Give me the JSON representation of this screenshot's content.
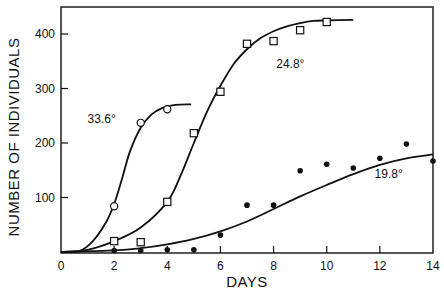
{
  "chart_data": {
    "type": "scatter",
    "title": "",
    "xlabel": "DAYS",
    "ylabel": "NUMBER OF INDIVIDUALS",
    "xlim": [
      0,
      14
    ],
    "ylim": [
      0,
      440
    ],
    "grid": false,
    "legend": "none (series labeled inline)",
    "x_ticks": [
      0,
      2,
      4,
      6,
      8,
      10,
      12,
      14
    ],
    "y_ticks": [
      100,
      200,
      300,
      400
    ],
    "series": [
      {
        "name": "33.6°",
        "marker": "open-circle",
        "points": [
          [
            2,
            84
          ],
          [
            3,
            237
          ],
          [
            4,
            262
          ]
        ],
        "curve": [
          [
            0,
            0
          ],
          [
            0.7,
            2
          ],
          [
            1.2,
            20
          ],
          [
            1.7,
            55
          ],
          [
            2,
            88
          ],
          [
            2.3,
            135
          ],
          [
            2.6,
            185
          ],
          [
            3,
            228
          ],
          [
            3.4,
            252
          ],
          [
            3.8,
            264
          ],
          [
            4.3,
            270
          ],
          [
            4.9,
            271
          ]
        ],
        "label_pos": [
          1,
          237
        ]
      },
      {
        "name": "24.8°",
        "marker": "open-square",
        "points": [
          [
            2,
            20
          ],
          [
            3,
            18
          ],
          [
            4,
            92
          ],
          [
            5,
            218
          ],
          [
            6,
            294
          ],
          [
            7,
            382
          ],
          [
            8,
            387
          ],
          [
            9,
            407
          ],
          [
            10,
            422
          ]
        ],
        "curve": [
          [
            0,
            0
          ],
          [
            1,
            4
          ],
          [
            2,
            20
          ],
          [
            3,
            45
          ],
          [
            4,
            92
          ],
          [
            4.5,
            140
          ],
          [
            5,
            200
          ],
          [
            5.5,
            258
          ],
          [
            6,
            305
          ],
          [
            6.5,
            345
          ],
          [
            7,
            372
          ],
          [
            7.5,
            392
          ],
          [
            8,
            405
          ],
          [
            8.5,
            414
          ],
          [
            9,
            420
          ],
          [
            9.5,
            424
          ],
          [
            10,
            425
          ],
          [
            11,
            426
          ]
        ],
        "label_pos": [
          8.1,
          337
        ]
      },
      {
        "name": "19.8°",
        "marker": "filled-circle",
        "points": [
          [
            2,
            0
          ],
          [
            3,
            0
          ],
          [
            4,
            4
          ],
          [
            5,
            4
          ],
          [
            6,
            31
          ],
          [
            7,
            86
          ],
          [
            8,
            86
          ],
          [
            9,
            149
          ],
          [
            10,
            161
          ],
          [
            11,
            154
          ],
          [
            12,
            172
          ],
          [
            13,
            198
          ],
          [
            14,
            167
          ]
        ],
        "curve": [
          [
            0,
            0
          ],
          [
            2,
            3
          ],
          [
            3,
            7
          ],
          [
            4,
            14
          ],
          [
            5,
            24
          ],
          [
            6,
            38
          ],
          [
            7,
            56
          ],
          [
            8,
            79
          ],
          [
            9,
            102
          ],
          [
            10,
            123
          ],
          [
            11,
            143
          ],
          [
            12,
            160
          ],
          [
            13,
            172
          ],
          [
            14,
            179
          ]
        ],
        "label_pos": [
          11.8,
          136
        ]
      }
    ]
  }
}
